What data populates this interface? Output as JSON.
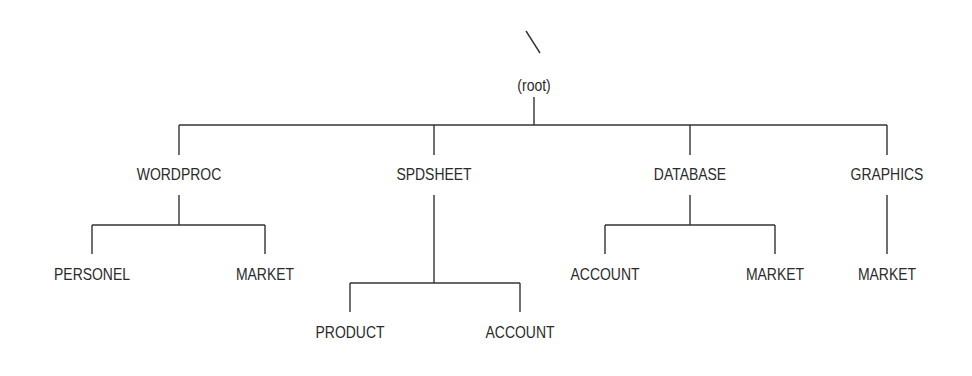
{
  "diagram": {
    "type": "tree",
    "colors": {
      "line": "#333333",
      "text": "#2a2a2a",
      "background": "#ffffff"
    },
    "root": {
      "label": "(root)",
      "x": 534,
      "y": 86
    },
    "nodes": [
      {
        "id": "wordproc",
        "label": "WORDPROC",
        "x": 179,
        "y": 175,
        "parent": "root"
      },
      {
        "id": "spdsheet",
        "label": "SPDSHEET",
        "x": 434,
        "y": 175,
        "parent": "root"
      },
      {
        "id": "database",
        "label": "DATABASE",
        "x": 690,
        "y": 175,
        "parent": "root"
      },
      {
        "id": "graphics",
        "label": "GRAPHICS",
        "x": 887,
        "y": 175,
        "parent": "root"
      },
      {
        "id": "wp_personel",
        "label": "PERSONEL",
        "x": 92,
        "y": 275,
        "parent": "wordproc"
      },
      {
        "id": "wp_market",
        "label": "MARKET",
        "x": 265,
        "y": 275,
        "parent": "wordproc"
      },
      {
        "id": "ss_product",
        "label": "PRODUCT",
        "x": 350,
        "y": 333,
        "parent": "spdsheet"
      },
      {
        "id": "ss_account",
        "label": "ACCOUNT",
        "x": 520,
        "y": 333,
        "parent": "spdsheet"
      },
      {
        "id": "db_account",
        "label": "ACCOUNT",
        "x": 605,
        "y": 275,
        "parent": "database"
      },
      {
        "id": "db_market",
        "label": "MARKET",
        "x": 775,
        "y": 275,
        "parent": "database"
      },
      {
        "id": "gr_market",
        "label": "MARKET",
        "x": 887,
        "y": 275,
        "parent": "graphics"
      }
    ]
  }
}
